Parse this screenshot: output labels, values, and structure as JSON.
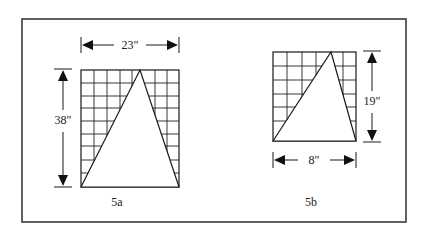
{
  "frame": {
    "x": 22,
    "y": 19,
    "w": 384,
    "h": 203
  },
  "figures": [
    {
      "id": "5a",
      "caption": "5a",
      "caption_pos": {
        "x": 117,
        "y": 206
      },
      "rect": {
        "x": 81,
        "y": 70,
        "w": 98,
        "h": 117
      },
      "cols": [
        94,
        107,
        120,
        132,
        155,
        167
      ],
      "rows": [
        83,
        96,
        108,
        121,
        134,
        146,
        160,
        173
      ],
      "triangle": {
        "left": [
          81,
          187
        ],
        "apex": [
          140,
          70
        ],
        "right": [
          179,
          187
        ]
      },
      "width_dim": {
        "label": "23\"",
        "y": 45,
        "x1": 81,
        "x2": 179,
        "label_x": 130
      },
      "height_dim": {
        "label": "38\"",
        "x": 63,
        "y1": 69,
        "y2": 187,
        "label_y": 124
      }
    },
    {
      "id": "5b",
      "caption": "5b",
      "caption_pos": {
        "x": 311,
        "y": 206
      },
      "rect": {
        "x": 273,
        "y": 52,
        "w": 83,
        "h": 89
      },
      "cols": [
        287,
        302,
        316,
        343
      ],
      "rows": [
        66,
        80,
        94,
        107,
        121
      ],
      "triangle": {
        "left": [
          273,
          141
        ],
        "apex": [
          331,
          52
        ],
        "right": [
          356,
          141
        ]
      },
      "width_dim": {
        "label": "8\"",
        "y": 160,
        "x1": 273,
        "x2": 356,
        "label_x": 314
      },
      "height_dim": {
        "label": "19\"",
        "x": 372,
        "y1": 51,
        "y2": 142,
        "label_y": 105
      }
    }
  ]
}
